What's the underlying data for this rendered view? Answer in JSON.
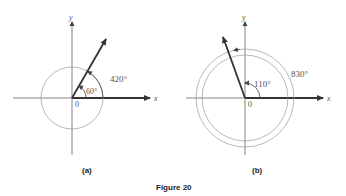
{
  "figure_title": "Figure 20",
  "panels": [
    {
      "id": "a",
      "caption": "(a)",
      "x_label": "x",
      "y_label": "y",
      "origin_label": "0",
      "reference_angle_label": "60°",
      "total_angle_label": "420°",
      "reference_angle_deg": 60,
      "total_angle_deg": 420,
      "revolutions_shown": 1
    },
    {
      "id": "b",
      "caption": "(b)",
      "x_label": "x",
      "y_label": "y",
      "origin_label": "0",
      "reference_angle_label": "110°",
      "total_angle_label": "830°",
      "reference_angle_deg": 110,
      "total_angle_deg": 830,
      "revolutions_shown": 2
    }
  ],
  "colors": {
    "axis": "#444444",
    "ray": "#333333",
    "circle": "#888888",
    "text": "#555555"
  }
}
